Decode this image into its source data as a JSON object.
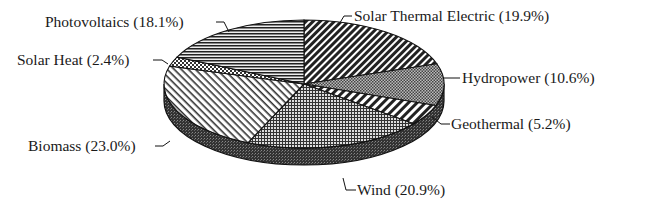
{
  "chart_data": {
    "type": "pie",
    "style": "3d-exploded-none-monochrome-hatched",
    "title": "",
    "start_angle": "12 o'clock",
    "direction": "clockwise",
    "slices": [
      {
        "label": "Solar Thermal Electric",
        "value": 19.9,
        "display": "Solar Thermal Electric (19.9%)",
        "pattern": "dense-diagonal-back"
      },
      {
        "label": "Hydropower",
        "value": 10.6,
        "display": "Hydropower (10.6%)",
        "pattern": "fine-crosshatch-gray"
      },
      {
        "label": "Geothermal",
        "value": 5.2,
        "display": "Geothermal (5.2%)",
        "pattern": "diagonal-back-wide"
      },
      {
        "label": "Wind",
        "value": 20.9,
        "display": "Wind (20.9%)",
        "pattern": "grid"
      },
      {
        "label": "Biomass",
        "value": 23.0,
        "display": "Biomass (23.0%)",
        "pattern": "diagonal-forward-light"
      },
      {
        "label": "Solar Heat",
        "value": 2.4,
        "display": "Solar Heat (2.4%)",
        "pattern": "checker"
      },
      {
        "label": "Photovoltaics",
        "value": 18.1,
        "display": "Photovoltaics (18.1%)",
        "pattern": "horizontal-lines"
      }
    ],
    "units": "%",
    "legend": "none (leader-line labels)"
  },
  "labels": {
    "solar_thermal": "Solar Thermal Electric (19.9%)",
    "hydropower": "Hydropower (10.6%)",
    "geothermal": "Geothermal (5.2%)",
    "wind": "Wind (20.9%)",
    "biomass": "Biomass (23.0%)",
    "solar_heat": "Solar Heat (2.4%)",
    "photovoltaics": "Photovoltaics (18.1%)"
  }
}
